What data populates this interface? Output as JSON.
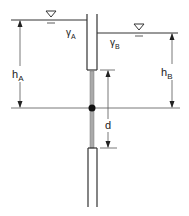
{
  "diagram": {
    "title": "",
    "fluid_a": {
      "symbol": "γ",
      "subscript": "A",
      "label": "γA"
    },
    "fluid_b": {
      "symbol": "γ",
      "subscript": "B",
      "label": "γB"
    },
    "height_a": {
      "symbol": "h",
      "subscript": "A"
    },
    "height_b": {
      "symbol": "h",
      "subscript": "B"
    },
    "offset": {
      "symbol": "d"
    },
    "free_surface_icon": "water-surface-triangle-icon",
    "colors": {
      "line": "#333333",
      "rod": "#999999",
      "dim": "#555555"
    }
  }
}
